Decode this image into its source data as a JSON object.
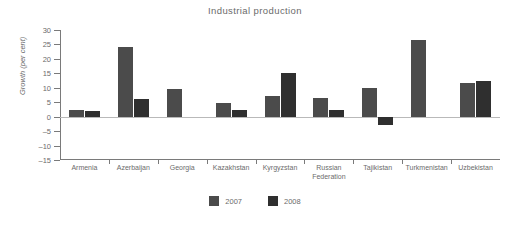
{
  "chart_data": {
    "type": "bar",
    "title": "Industrial production",
    "xlabel": "",
    "ylabel": "Growth (per cent)",
    "ylim": [
      -15,
      30
    ],
    "yticks": [
      30,
      25,
      20,
      15,
      10,
      5,
      0,
      -5,
      -10,
      -15
    ],
    "ytick_labels": [
      "30",
      "25",
      "20",
      "15",
      "10",
      "5",
      "0",
      "–5",
      "–10",
      "–15"
    ],
    "grid": false,
    "legend_position": "bottom",
    "categories": [
      "Armenia",
      "Azerbaijan",
      "Georgia",
      "Kazakhstan",
      "Kyrgyzstan",
      "Russian\nFederation",
      "Tajikistan",
      "Turkmenistan",
      "Uzbekistan"
    ],
    "series": [
      {
        "name": "2007",
        "color": "#4b4b4b",
        "values": [
          2.3,
          24.0,
          9.5,
          4.6,
          7.3,
          6.4,
          10.0,
          26.5,
          11.8
        ]
      },
      {
        "name": "2008",
        "color": "#2f2f2f",
        "values": [
          2.0,
          6.0,
          null,
          2.2,
          15.0,
          2.2,
          -3.0,
          null,
          12.3
        ]
      }
    ]
  },
  "legend": {
    "items": [
      {
        "label": "2007"
      },
      {
        "label": "2008"
      }
    ]
  }
}
